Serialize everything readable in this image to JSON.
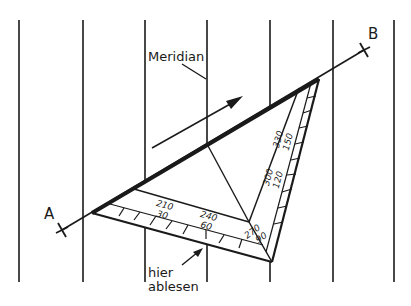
{
  "labels": {
    "meridian": "Meridian",
    "point_a": "A",
    "point_b": "B",
    "read_here_line1": "hier",
    "read_here_line2": "ablesen"
  },
  "scale_marks": [
    {
      "top": "210",
      "bottom": "30"
    },
    {
      "top": "240",
      "bottom": "60"
    },
    {
      "top": "270",
      "bottom": "90"
    },
    {
      "top": "300",
      "bottom": "120"
    },
    {
      "top": "330",
      "bottom": "150"
    }
  ],
  "colors": {
    "ink": "#1a1a1a",
    "background": "#ffffff"
  }
}
